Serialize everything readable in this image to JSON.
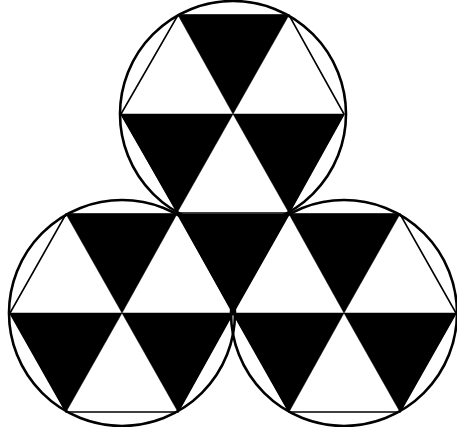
{
  "diagram": {
    "title": "Three circles with inscribed hexagons tiled by alternating black and white triangles",
    "colors": {
      "fill_dark": "#000000",
      "fill_light": "#ffffff",
      "stroke": "#000000",
      "background": "#ffffff"
    },
    "circles": [
      {
        "id": "top",
        "cx": 233,
        "cy": 114,
        "r": 113
      },
      {
        "id": "left",
        "cx": 122,
        "cy": 313,
        "r": 113
      },
      {
        "id": "right",
        "cx": 344,
        "cy": 313,
        "r": 113
      }
    ],
    "hexagons": [
      {
        "id": "top",
        "points": "178,15 289,15 344,114 289,213 178,213 121,114"
      },
      {
        "id": "left",
        "points": "66,214 178,214 233,313 178,412 66,412 10,313"
      },
      {
        "id": "right",
        "points": "289,214 400,214 456,313 400,412 289,412 233,313"
      }
    ],
    "black_triangles": [
      "178,15 289,15 233,114",
      "121,114 233,114 177,213",
      "233,114 344,114 289,213",
      "66,214 177,214 122,313",
      "177,214 289,214 233,313",
      "289,214 400,214 344,313",
      "10,313 122,313 66,412",
      "122,313 233,313 178,412",
      "233,313 344,313 289,412",
      "344,313 456,313 400,412"
    ]
  }
}
